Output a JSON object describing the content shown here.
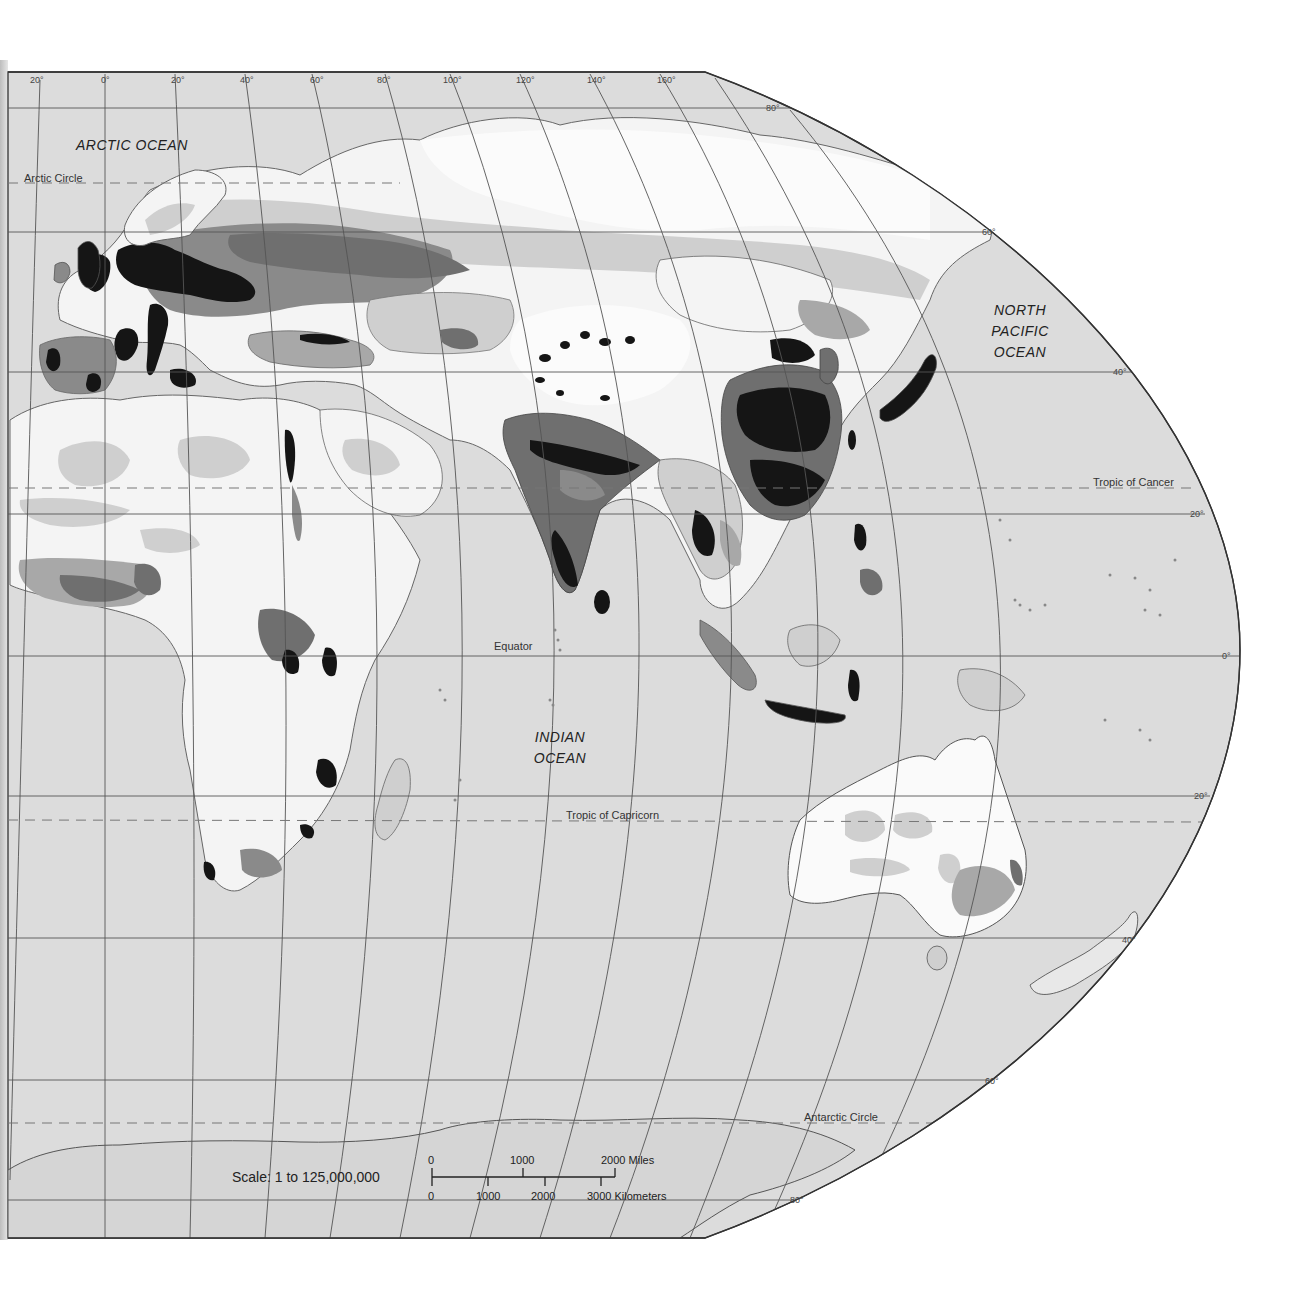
{
  "map": {
    "type": "population-density-map",
    "region": "Eastern Hemisphere",
    "colors": {
      "water": "#dcdcdc",
      "outside": "#ffffff",
      "land_sparse": "#f7f7f7",
      "land_low": "#cfcfcf",
      "land_medium": "#a8a8a8",
      "land_high": "#6f6f6f",
      "land_very_high": "#151515",
      "graticule": "#555555",
      "border": "#666666"
    },
    "oceans": [
      {
        "id": "arctic",
        "label": "ARCTIC   OCEAN"
      },
      {
        "id": "north-pacific",
        "lines": [
          "NORTH",
          "PACIFIC",
          "OCEAN"
        ]
      },
      {
        "id": "indian",
        "lines": [
          "INDIAN",
          "OCEAN"
        ]
      }
    ],
    "reference_lines": {
      "arctic_circle": "Arctic Circle",
      "tropic_of_cancer": "Tropic of Cancer",
      "equator": "Equator",
      "tropic_of_capricorn": "Tropic of Capricorn",
      "antarctic_circle": "Antarctic Circle"
    },
    "longitude_labels": [
      "20°",
      "0°",
      "20°",
      "40°",
      "60°",
      "80°",
      "100°",
      "120°",
      "140°",
      "160°"
    ],
    "latitude_labels": {
      "n80": "80°",
      "n60": "60°",
      "n40": "40°",
      "n20": "20°",
      "eq": "0°",
      "s20": "20°",
      "s40": "40°",
      "s60": "60°",
      "s80": "80°"
    },
    "scale": {
      "ratio_label": "Scale:  1 to 125,000,000",
      "miles": {
        "ticks": [
          "0",
          "1000",
          "2000 Miles"
        ]
      },
      "kilometers": {
        "ticks": [
          "0",
          "1000",
          "2000",
          "3000 Kilometers"
        ]
      }
    }
  }
}
